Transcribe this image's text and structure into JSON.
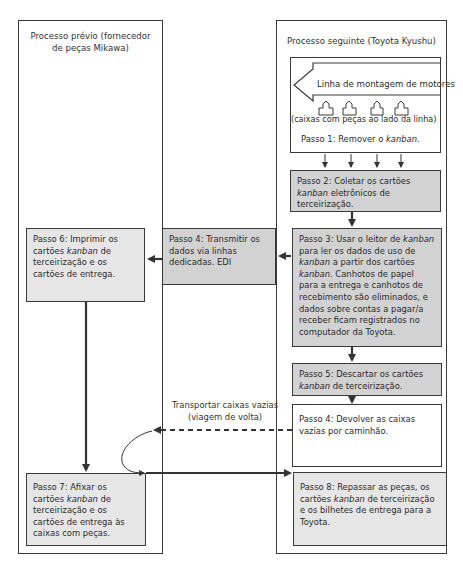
{
  "columns": {
    "left": {
      "title_line1": "Processo prévio (fornecedor",
      "title_line2": "de peças Mikawa)"
    },
    "right": {
      "title": "Processo seguinte (Toyota Kyushu)"
    }
  },
  "assembly": {
    "line_label": "Linha de montagem de motores",
    "boxes_label": "(caixas com peças ao lado da linha)",
    "step1_prefix": "Passo 1: Remover o ",
    "step1_italic": "kanban",
    "step1_suffix": ".",
    "box_icon_count": 4
  },
  "steps": {
    "step2": {
      "prefix": "Passo 2: Coletar os cartões ",
      "italic": "kanban",
      "suffix": " eletrônicos de terceirização."
    },
    "step3": {
      "p1": "Passo 3: Usar o leitor de ",
      "i1": "kanban",
      "p2": " para ler os dados de uso de ",
      "i2": "kanban",
      "p3": " a partir dos cartões ",
      "i3": "kanban",
      "p4": ". Canhotos de papel para a entrega e canhotos de recebimento são eliminados, e dados sobre contas a pagar/a receber ficam registrados no computador da Toyota."
    },
    "step4_edi": {
      "text": "Passo 4: Transmitir os dados via linhas dedicadas. EDI"
    },
    "step6": {
      "prefix": "Passo 6: Imprimir os cartões ",
      "italic": "kanban",
      "suffix": " de terceirização e os cartões de entrega."
    },
    "step5": {
      "prefix": "Passo 5: Descartar os cartões ",
      "italic": "kanban",
      "suffix": " de terceirização."
    },
    "step4_return": {
      "text": "Passo 4: Devolver as caixas vazias por caminhão."
    },
    "step7": {
      "prefix": "Passo 7: Afixar os cartões ",
      "italic": "kanban",
      "suffix": " de terceirização e os cartões de entrega às caixas com peças."
    },
    "step8": {
      "prefix": "Passo 8: Repassar as peças, os cartões ",
      "italic": "kanban",
      "suffix": " de terceirização e os bilhetes de entrega para a Toyota."
    }
  },
  "return_trip": {
    "line1": "Transportar caixas vazias",
    "line2": "(viagem de volta)"
  },
  "colors": {
    "gray_box": "#d2d2d2",
    "light_gray_box": "#e6e6e6",
    "line": "#3a3a3a"
  }
}
